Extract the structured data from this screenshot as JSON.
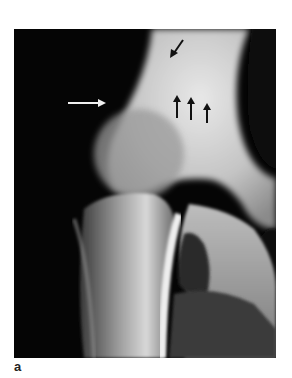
{
  "figure": {
    "type": "radiograph",
    "panel_label": "a",
    "annotations": [
      {
        "kind": "arrow",
        "color": "#ffffff",
        "direction": "right",
        "from": [
          54,
          74
        ],
        "to": [
          92,
          74
        ]
      },
      {
        "kind": "arrow",
        "color": "#111111",
        "direction": "down-left",
        "from": [
          169,
          11
        ],
        "to": [
          157,
          28
        ]
      },
      {
        "kind": "arrow",
        "color": "#111111",
        "direction": "up",
        "from": [
          163,
          89
        ],
        "to": [
          163,
          66
        ]
      },
      {
        "kind": "arrow",
        "color": "#111111",
        "direction": "up",
        "from": [
          177,
          91
        ],
        "to": [
          177,
          68
        ]
      },
      {
        "kind": "arrow",
        "color": "#111111",
        "direction": "up",
        "from": [
          193,
          94
        ],
        "to": [
          193,
          74
        ]
      }
    ]
  }
}
